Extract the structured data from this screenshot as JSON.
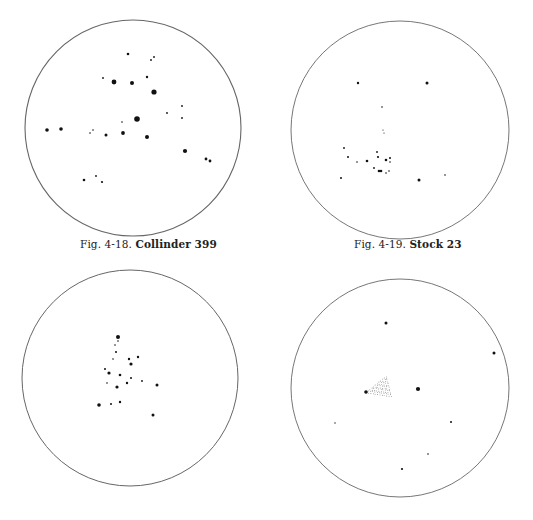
{
  "page": {
    "width": 533,
    "height": 520,
    "background": "#ffffff",
    "ink_color": "#111111",
    "circle_stroke_color": "#666666"
  },
  "figures": [
    {
      "id": "fig-4-18",
      "label": "Fig. 4-18.",
      "name": "Collinder 399",
      "caption_pos": {
        "x": 80,
        "y": 244
      },
      "circle": {
        "cx": 133,
        "cy": 128,
        "r": 108,
        "stroke_width": 1.1
      },
      "stars": [
        {
          "x": 128,
          "y": 54,
          "r": 1.3
        },
        {
          "x": 151,
          "y": 60,
          "r": 0.9
        },
        {
          "x": 154,
          "y": 57,
          "r": 0.9
        },
        {
          "x": 103,
          "y": 78,
          "r": 0.9
        },
        {
          "x": 114,
          "y": 82,
          "r": 2.4
        },
        {
          "x": 132,
          "y": 83,
          "r": 2.0
        },
        {
          "x": 147,
          "y": 77,
          "r": 1.2
        },
        {
          "x": 154,
          "y": 92,
          "r": 2.6
        },
        {
          "x": 182,
          "y": 106,
          "r": 0.9
        },
        {
          "x": 167,
          "y": 113,
          "r": 0.9
        },
        {
          "x": 182,
          "y": 118,
          "r": 0.9
        },
        {
          "x": 137,
          "y": 119,
          "r": 2.8
        },
        {
          "x": 122,
          "y": 122,
          "r": 0.8
        },
        {
          "x": 47,
          "y": 130,
          "r": 1.8
        },
        {
          "x": 61,
          "y": 129,
          "r": 1.8
        },
        {
          "x": 90,
          "y": 133,
          "r": 0.8
        },
        {
          "x": 93,
          "y": 130,
          "r": 0.8
        },
        {
          "x": 106,
          "y": 135,
          "r": 1.5
        },
        {
          "x": 123,
          "y": 133,
          "r": 1.9
        },
        {
          "x": 147,
          "y": 137,
          "r": 2.0
        },
        {
          "x": 185,
          "y": 151,
          "r": 2.1
        },
        {
          "x": 206,
          "y": 159,
          "r": 1.4
        },
        {
          "x": 210,
          "y": 161,
          "r": 1.4
        },
        {
          "x": 84,
          "y": 180,
          "r": 1.3
        },
        {
          "x": 96,
          "y": 176,
          "r": 0.9
        },
        {
          "x": 102,
          "y": 182,
          "r": 1.1
        }
      ]
    },
    {
      "id": "fig-4-19",
      "label": "Fig. 4-19.",
      "name": "Stock 23",
      "caption_pos": {
        "x": 354,
        "y": 244
      },
      "circle": {
        "cx": 400,
        "cy": 130,
        "r": 109,
        "stroke_width": 0.9
      },
      "stars": [
        {
          "x": 358,
          "y": 83,
          "r": 1.2
        },
        {
          "x": 427,
          "y": 83,
          "r": 1.5
        },
        {
          "x": 382,
          "y": 107,
          "r": 0.8
        },
        {
          "x": 383,
          "y": 130,
          "r": 0.6
        },
        {
          "x": 384,
          "y": 133,
          "r": 0.6
        },
        {
          "x": 344,
          "y": 148,
          "r": 0.9
        },
        {
          "x": 348,
          "y": 157,
          "r": 1.0
        },
        {
          "x": 357,
          "y": 162,
          "r": 0.8
        },
        {
          "x": 367,
          "y": 161,
          "r": 1.3
        },
        {
          "x": 377,
          "y": 152,
          "r": 0.9
        },
        {
          "x": 378,
          "y": 157,
          "r": 1.1
        },
        {
          "x": 386,
          "y": 160,
          "r": 1.3
        },
        {
          "x": 390,
          "y": 158,
          "r": 1.0
        },
        {
          "x": 390,
          "y": 162,
          "r": 0.8
        },
        {
          "x": 374,
          "y": 168,
          "r": 0.9
        },
        {
          "x": 379,
          "y": 171,
          "r": 1.3
        },
        {
          "x": 381,
          "y": 171,
          "r": 1.3
        },
        {
          "x": 386,
          "y": 173,
          "r": 0.8
        },
        {
          "x": 389,
          "y": 171,
          "r": 0.8
        },
        {
          "x": 341,
          "y": 178,
          "r": 1.0
        },
        {
          "x": 419,
          "y": 180,
          "r": 1.5
        },
        {
          "x": 445,
          "y": 175,
          "r": 0.8
        }
      ]
    },
    {
      "id": "fig-bottom-left",
      "label": "",
      "name": "",
      "circle": {
        "cx": 130,
        "cy": 378,
        "r": 108,
        "stroke_width": 1.0
      },
      "stars": [
        {
          "x": 118,
          "y": 337,
          "r": 2.0
        },
        {
          "x": 118,
          "y": 341,
          "r": 0.8
        },
        {
          "x": 115,
          "y": 345,
          "r": 0.8
        },
        {
          "x": 116,
          "y": 352,
          "r": 1.0
        },
        {
          "x": 113,
          "y": 359,
          "r": 0.8
        },
        {
          "x": 129,
          "y": 359,
          "r": 1.2
        },
        {
          "x": 138,
          "y": 357,
          "r": 1.2
        },
        {
          "x": 131,
          "y": 364,
          "r": 1.6
        },
        {
          "x": 105,
          "y": 369,
          "r": 1.0
        },
        {
          "x": 109,
          "y": 373,
          "r": 1.6
        },
        {
          "x": 120,
          "y": 375,
          "r": 1.3
        },
        {
          "x": 131,
          "y": 378,
          "r": 1.0
        },
        {
          "x": 127,
          "y": 383,
          "r": 1.2
        },
        {
          "x": 142,
          "y": 381,
          "r": 0.9
        },
        {
          "x": 107,
          "y": 383,
          "r": 0.8
        },
        {
          "x": 117,
          "y": 387,
          "r": 1.6
        },
        {
          "x": 157,
          "y": 385,
          "r": 1.5
        },
        {
          "x": 99,
          "y": 405,
          "r": 1.8
        },
        {
          "x": 111,
          "y": 404,
          "r": 1.0
        },
        {
          "x": 120,
          "y": 402,
          "r": 1.2
        },
        {
          "x": 153,
          "y": 415,
          "r": 1.5
        }
      ]
    },
    {
      "id": "fig-bottom-right",
      "label": "",
      "name": "",
      "circle": {
        "cx": 400,
        "cy": 388,
        "r": 109,
        "stroke_width": 0.9
      },
      "nebula": {
        "points": "366,392 386,376 391,396",
        "anchor_star": {
          "x": 366,
          "y": 392,
          "r": 1.8
        }
      },
      "stars": [
        {
          "x": 386,
          "y": 323,
          "r": 1.5
        },
        {
          "x": 494,
          "y": 353,
          "r": 1.5
        },
        {
          "x": 418,
          "y": 389,
          "r": 2.1
        },
        {
          "x": 335,
          "y": 423,
          "r": 0.7
        },
        {
          "x": 451,
          "y": 422,
          "r": 1.0
        },
        {
          "x": 428,
          "y": 454,
          "r": 0.8
        },
        {
          "x": 402,
          "y": 469,
          "r": 1.1
        }
      ]
    }
  ]
}
